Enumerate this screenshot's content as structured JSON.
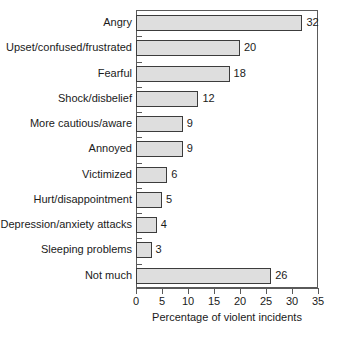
{
  "chart_data": {
    "type": "bar",
    "orientation": "horizontal",
    "title": "",
    "xlabel": "Percentage of violent incidents",
    "ylabel": "",
    "xlim": [
      0,
      35
    ],
    "xticks": [
      0,
      5,
      10,
      15,
      20,
      25,
      30,
      35
    ],
    "grid": false,
    "legend": null,
    "bar_fill_color": "#dedede",
    "bar_border_color": "#3c3c3c",
    "categories": [
      "Angry",
      "Upset/confused/frustrated",
      "Fearful",
      "Shock/disbelief",
      "More cautious/aware",
      "Annoyed",
      "Victimized",
      "Hurt/disappointment",
      "Depression/anxiety attacks",
      "Sleeping problems",
      "Not much"
    ],
    "values": [
      32,
      20,
      18,
      12,
      9,
      9,
      6,
      5,
      4,
      3,
      26
    ],
    "value_labels": [
      "32",
      "20",
      "18",
      "12",
      "9",
      "9",
      "6",
      "5",
      "4",
      "3",
      "26"
    ],
    "xtick_labels": [
      "0",
      "5",
      "10",
      "15",
      "20",
      "25",
      "30",
      "35"
    ]
  }
}
